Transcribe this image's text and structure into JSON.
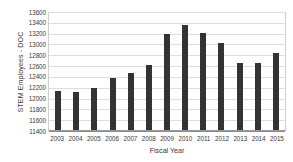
{
  "chart_data": {
    "type": "bar",
    "title": "",
    "xlabel": "Fiscal Year",
    "ylabel": "STEM Employees - DOC",
    "categories": [
      "2003",
      "2004",
      "2005",
      "2006",
      "2007",
      "2008",
      "2009",
      "2010",
      "2011",
      "2012",
      "2013",
      "2014",
      "2015"
    ],
    "values": [
      12120,
      12110,
      12185,
      12355,
      12460,
      12610,
      13180,
      13340,
      13200,
      13000,
      12645,
      12640,
      12815
    ],
    "ylim": [
      11400,
      13600
    ],
    "yticks": [
      13600,
      13400,
      13200,
      13000,
      12800,
      12600,
      12400,
      12200,
      12000,
      11800,
      11600,
      11400
    ],
    "grid": true,
    "legend": "none",
    "bar_color": "#333333",
    "gridline_color": "#dedede",
    "axis_color": "#8c8c8c",
    "background": "#ffffff"
  }
}
